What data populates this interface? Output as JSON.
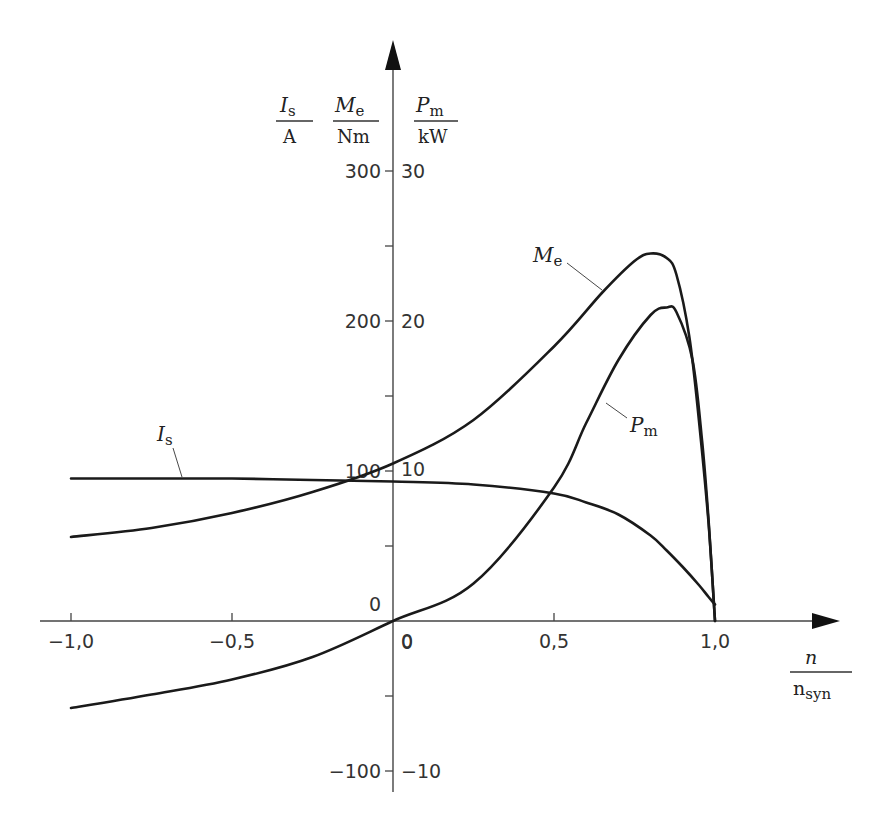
{
  "chart_data": {
    "type": "line",
    "title": "",
    "xlabel": {
      "numerator": "n",
      "denominator": "n",
      "denominator_sub": "syn"
    },
    "ylabels": [
      {
        "symbol": "I",
        "sub": "s",
        "unit": "A"
      },
      {
        "symbol": "M",
        "sub": "e",
        "unit": "Nm"
      },
      {
        "symbol": "P",
        "sub": "m",
        "unit": "kW"
      }
    ],
    "xlim": [
      -1.0,
      1.25
    ],
    "ylim_left": [
      -110,
      385
    ],
    "ylim_right": [
      -11,
      38.5
    ],
    "x_ticks": [
      {
        "value": -1.0,
        "label": "−1,0"
      },
      {
        "value": -0.5,
        "label": "−0,5"
      },
      {
        "value": 0.0,
        "label": "0"
      },
      {
        "value": 0.5,
        "label": "0,5"
      },
      {
        "value": 1.0,
        "label": "1,0"
      }
    ],
    "y_ticks_left": [
      {
        "value": 300,
        "label": "300"
      },
      {
        "value": 250,
        "label": ""
      },
      {
        "value": 200,
        "label": "200"
      },
      {
        "value": 150,
        "label": ""
      },
      {
        "value": 100,
        "label": "100"
      },
      {
        "value": 50,
        "label": ""
      },
      {
        "value": 0,
        "label": "0"
      },
      {
        "value": -50,
        "label": ""
      },
      {
        "value": -100,
        "label": "−100"
      }
    ],
    "y_ticks_right": [
      {
        "value": 30,
        "label": "30"
      },
      {
        "value": 20,
        "label": "20"
      },
      {
        "value": 10,
        "label": "10"
      },
      {
        "value": 0,
        "label": "0"
      },
      {
        "value": -10,
        "label": "−10"
      }
    ],
    "grid": false,
    "legend": "inline labels",
    "series": [
      {
        "name": "M_e",
        "label": {
          "symbol": "M",
          "sub": "e"
        },
        "axis": "left",
        "unit": "Nm",
        "x": [
          -1.0,
          -0.75,
          -0.5,
          -0.25,
          0.0,
          0.25,
          0.5,
          0.65,
          0.75,
          0.8,
          0.85,
          0.88,
          0.92,
          0.95,
          0.98,
          1.0
        ],
        "values": [
          56,
          62,
          72,
          86,
          105,
          134,
          183,
          219,
          240,
          245,
          242,
          231,
          190,
          134,
          65,
          0
        ]
      },
      {
        "name": "I_s",
        "label": {
          "symbol": "I",
          "sub": "s"
        },
        "axis": "left",
        "unit": "A",
        "x": [
          -1.0,
          -0.75,
          -0.5,
          -0.25,
          0.0,
          0.25,
          0.5,
          0.6,
          0.7,
          0.8,
          0.85,
          0.9,
          0.95,
          0.98,
          1.0
        ],
        "values": [
          95,
          95,
          95,
          94,
          93,
          91,
          85,
          79,
          71,
          57,
          47,
          36,
          24,
          16,
          11
        ]
      },
      {
        "name": "P_m",
        "label": {
          "symbol": "P",
          "sub": "m"
        },
        "axis": "right",
        "unit": "kW",
        "x": [
          -1.0,
          -0.75,
          -0.5,
          -0.25,
          0.0,
          0.25,
          0.5,
          0.6,
          0.7,
          0.8,
          0.85,
          0.88,
          0.93,
          0.96,
          0.98,
          1.0
        ],
        "values": [
          -5.8,
          -4.9,
          -3.9,
          -2.4,
          0.0,
          2.5,
          8.9,
          13.2,
          17.4,
          20.4,
          20.9,
          20.6,
          17.4,
          12.0,
          6.7,
          0.0
        ]
      }
    ]
  }
}
